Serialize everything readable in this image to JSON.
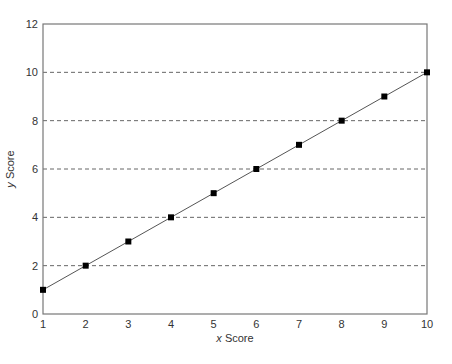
{
  "chart_data": {
    "type": "line",
    "title": "",
    "xlabel_italic": "x",
    "xlabel_rest": " Score",
    "ylabel_italic": "y",
    "ylabel_rest": " Score",
    "xlabel": "x Score",
    "ylabel": "y Score",
    "xlim": [
      1,
      10
    ],
    "ylim": [
      0,
      12
    ],
    "x_ticks": [
      1,
      2,
      3,
      4,
      5,
      6,
      7,
      8,
      9,
      10
    ],
    "y_ticks": [
      0,
      2,
      4,
      6,
      8,
      10,
      12
    ],
    "grid": "horizontal dashed at y = 2,4,6,8,10",
    "legend": null,
    "marker": "square",
    "series": [
      {
        "name": "y = x",
        "x": [
          1,
          2,
          3,
          4,
          5,
          6,
          7,
          8,
          9,
          10
        ],
        "values": [
          1,
          2,
          3,
          4,
          5,
          6,
          7,
          8,
          9,
          10
        ]
      }
    ]
  },
  "colors": {
    "axis": "#777777",
    "grid": "#666666",
    "line": "#555555",
    "marker": "#000000"
  }
}
